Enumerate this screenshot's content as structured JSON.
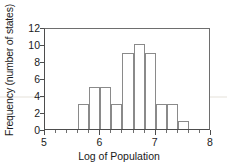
{
  "chart_data": {
    "type": "bar",
    "title": "",
    "subtitle": "",
    "xlabel": "Log of Population",
    "ylabel": "Frequency (number of states)",
    "xlim": [
      5,
      8
    ],
    "ylim": [
      0,
      12
    ],
    "grid": false,
    "legend": null,
    "bin_width": 0.2,
    "bin_edges": [
      5.6,
      5.8,
      6.0,
      6.2,
      6.4,
      6.6,
      6.8,
      7.0,
      7.2,
      7.4,
      7.6
    ],
    "categories": [
      "5.6-5.8",
      "5.8-6.0",
      "6.0-6.2",
      "6.2-6.4",
      "6.4-6.6",
      "6.6-6.8",
      "6.8-7.0",
      "7.0-7.2",
      "7.2-7.4",
      "7.4-7.6"
    ],
    "values": [
      3,
      5,
      5,
      3,
      9,
      10,
      9,
      3,
      3,
      1
    ],
    "bar_starts": [
      5.6,
      5.8,
      6.0,
      6.2,
      6.4,
      6.6,
      6.8,
      7.0,
      7.2,
      7.4
    ],
    "xticks_major": [
      5,
      6,
      7,
      8
    ],
    "xtick_labels": [
      "5",
      "6",
      "7",
      "8"
    ],
    "xticks_minor": [
      5.2,
      5.4,
      5.6,
      5.8,
      6.2,
      6.4,
      6.6,
      6.8,
      7.2,
      7.4,
      7.6,
      7.8
    ],
    "yticks": [
      0,
      2,
      4,
      6,
      8,
      10,
      12
    ],
    "ytick_labels": [
      "0",
      "2",
      "4",
      "6",
      "8",
      "10",
      "12"
    ],
    "colors": {
      "bar_stroke": "#8a8a8a",
      "bar_fill": "none",
      "axis": "#4d4d4d",
      "frame": "#6e6e6e",
      "text": "#1a1a1a",
      "background": "#ffffff"
    }
  }
}
